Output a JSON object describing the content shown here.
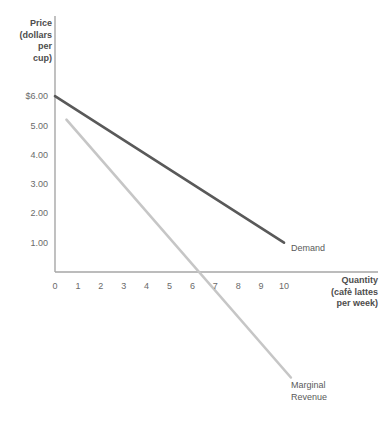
{
  "chart_data": {
    "type": "line",
    "title": "",
    "xlabel": "Quantity (cafè lattes per week)",
    "ylabel": "Price (dollars per cup)",
    "xlim": [
      0,
      10.6
    ],
    "ylim": [
      -4.2,
      6.4
    ],
    "grid": false,
    "legend_position": "inline-end-labels",
    "xticks": [
      "0",
      "1",
      "2",
      "3",
      "4",
      "5",
      "6",
      "7",
      "8",
      "9",
      "10"
    ],
    "xtick_values": [
      0,
      1,
      2,
      3,
      4,
      5,
      6,
      7,
      8,
      9,
      10
    ],
    "yticks": [
      "$6.00",
      "5.00",
      "4.00",
      "3.00",
      "2.00",
      "1.00"
    ],
    "ytick_values": [
      6,
      5,
      4,
      3,
      2,
      1
    ],
    "series": [
      {
        "name": "Demand",
        "color": "#595959",
        "width": 2.6,
        "points": [
          [
            0,
            6.0
          ],
          [
            10,
            1.0
          ]
        ]
      },
      {
        "name": "Marginal Revenue",
        "color": "#c6c6c6",
        "width": 2.6,
        "points": [
          [
            0.5,
            5.2
          ],
          [
            10.3,
            -3.6
          ]
        ]
      }
    ],
    "annotations": [
      {
        "text": "Demand",
        "x": 10.2,
        "y": 0.55
      },
      {
        "text": "Marginal\nRevenue",
        "x": 10.3,
        "y": -3.9
      }
    ]
  },
  "axis": {
    "y_title": "Price\n(dollars\nper\ncup)",
    "x_title": "Quantity\n(cafè lattes\nper week)",
    "axis_color": "#a6a6a6"
  },
  "labels": {
    "demand": "Demand",
    "marginal_revenue": "Marginal\nRevenue"
  }
}
